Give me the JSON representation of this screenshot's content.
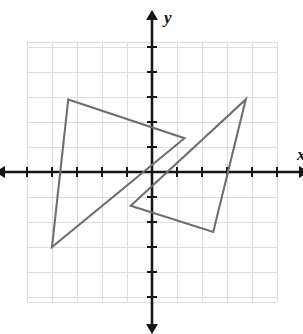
{
  "figure": {
    "kind": "coordinate-plane-with-polygons",
    "background_color": "#ffffff",
    "width": 303,
    "height": 334
  },
  "axes": {
    "x_label": "x",
    "y_label": "y",
    "axis_color": "#161616",
    "grid_color": "#dcdcdc",
    "origin_px": {
      "x": 152,
      "y": 172
    },
    "pixels_per_unit": 25,
    "x_range": [
      -5,
      5
    ],
    "y_range": [
      -5.2,
      5.2
    ],
    "grid_visible": true,
    "tick_labels_visible": false,
    "x_ticks": [
      -5,
      -4,
      -3,
      -2,
      -1,
      1,
      2,
      3,
      4,
      5
    ],
    "y_ticks": [
      -5,
      -4,
      -3,
      -2,
      -1,
      1,
      2,
      3,
      4,
      5
    ],
    "grid_bounds_units": {
      "left": -5,
      "right": 5,
      "top": 5.2,
      "bottom": -5.2
    }
  },
  "chart_data": {
    "type": "scatter",
    "title": "",
    "xlabel": "x",
    "ylabel": "y",
    "xlim": [
      -5,
      5
    ],
    "ylim": [
      -5.2,
      5.2
    ],
    "grid": true,
    "legend": "none",
    "shapes": [
      {
        "name": "left-triangle",
        "type": "triangle",
        "stroke": "#6e6e6e",
        "fill": "none",
        "vertices": [
          {
            "x": -3.35,
            "y": 2.9
          },
          {
            "x": 1.3,
            "y": 1.35
          },
          {
            "x": -4.0,
            "y": -3.0
          }
        ]
      },
      {
        "name": "right-triangle",
        "type": "triangle",
        "stroke": "#6e6e6e",
        "fill": "none",
        "vertices": [
          {
            "x": 3.75,
            "y": 2.9
          },
          {
            "x": 2.45,
            "y": -2.4
          },
          {
            "x": -0.85,
            "y": -1.35
          }
        ]
      }
    ]
  }
}
